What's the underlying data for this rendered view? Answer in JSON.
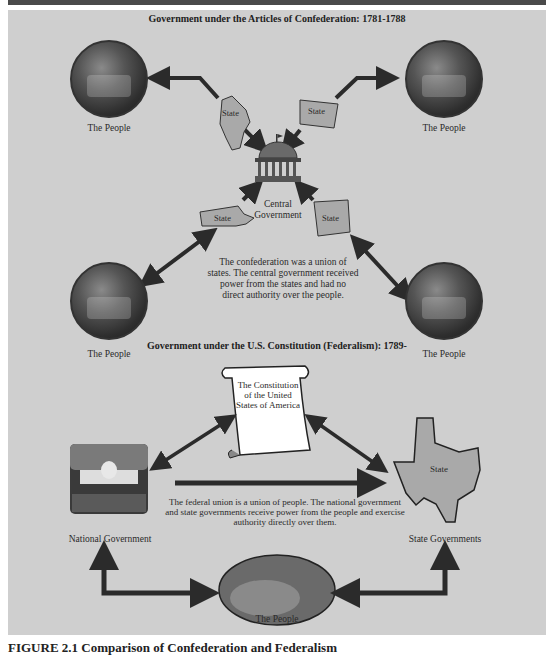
{
  "figure": {
    "caption": "FIGURE 2.1 Comparison of Confederation and Federalism"
  },
  "confederation": {
    "title": "Government under the Articles of Confederation: 1781-1788",
    "people_labels": [
      "The People",
      "The People",
      "The People",
      "The People"
    ],
    "state_labels": [
      "State",
      "State",
      "State",
      "State"
    ],
    "center_label_line1": "Central",
    "center_label_line2": "Government",
    "description_lines": [
      "The confederation was a union of",
      "states. The central government received",
      "power from the states and had no",
      "direct authority over the people."
    ]
  },
  "federalism": {
    "title": "Government under the U.S. Constitution (Federalism): 1789-",
    "constitution_lines": [
      "The Constitution",
      "of the United",
      "States of America"
    ],
    "national_label": "National Government",
    "state_label": "State Governments",
    "state_map_label": "State",
    "people_label": "The People",
    "description_lines": [
      "The federal union is a union of people. The national government",
      "and state governments receive power from the people and exercise",
      "authority directly over them."
    ]
  },
  "colors": {
    "panel": "#cfcfcf",
    "arrow": "#2b2b2b",
    "state_fill": "#a9a9a9",
    "scroll_fill": "#ffffff"
  }
}
